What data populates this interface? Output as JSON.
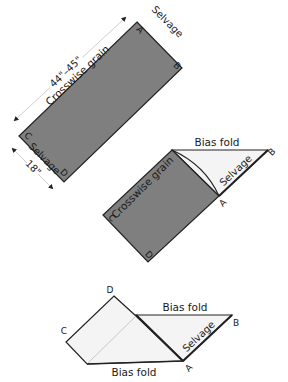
{
  "figures": [
    {
      "id": "step1",
      "labels": {
        "width_measure": "44\"–45\"",
        "height_measure": "18\"",
        "grain": "Crosswise grain",
        "selvage_top": "Selvage",
        "selvage_bottom": "Selvage",
        "corner_a": "A",
        "corner_b": "B",
        "corner_c": "C",
        "corner_d": "D"
      }
    },
    {
      "id": "step2",
      "labels": {
        "bias_fold": "Bias fold",
        "grain": "Crosswise grain",
        "selvage": "Selvage",
        "corner_a": "A",
        "corner_b": "B",
        "corner_c": "C",
        "corner_d": "D"
      }
    },
    {
      "id": "step3",
      "labels": {
        "bias_fold_top": "Bias fold",
        "bias_fold_bottom": "Bias fold",
        "selvage": "Selvage",
        "corner_a": "A",
        "corner_b": "B",
        "corner_c": "C",
        "corner_d": "D"
      }
    }
  ],
  "colors": {
    "fabric_dark": "#7f7f7f",
    "fabric_light": "#f4f4f4",
    "outline": "#222222"
  }
}
